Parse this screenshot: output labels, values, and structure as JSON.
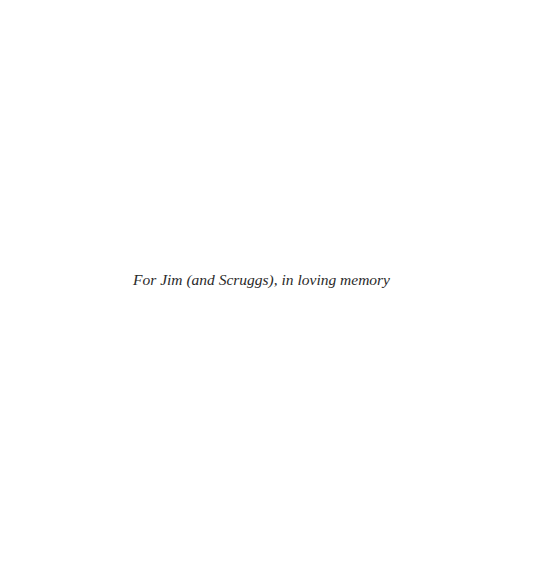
{
  "page": {
    "dedication": "For Jim (and Scruggs), in loving memory"
  }
}
